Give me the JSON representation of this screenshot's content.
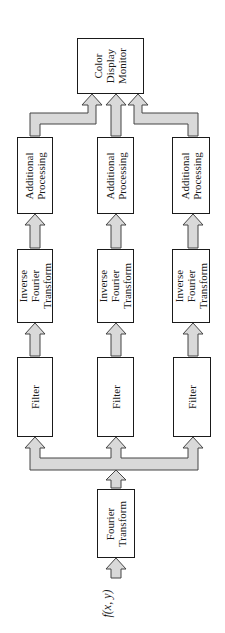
{
  "diagram": {
    "title": "",
    "colors": {
      "arrow_fill": "#d9d9d9",
      "arrow_stroke": "#444444",
      "box_stroke": "#1a1a1a"
    },
    "input_label": "f(x, y)",
    "fourier": {
      "line1": "Fourier",
      "line2": "Transform"
    },
    "channels": [
      {
        "filter": "Filter",
        "ift": {
          "line1": "Inverse",
          "line2": "Fourier",
          "line3": "Transform"
        },
        "proc": {
          "line1": "Additional",
          "line2": "Processing"
        }
      },
      {
        "filter": "Filter",
        "ift": {
          "line1": "Inverse",
          "line2": "Fourier",
          "line3": "Transform"
        },
        "proc": {
          "line1": "Additional",
          "line2": "Processing"
        }
      },
      {
        "filter": "Filter",
        "ift": {
          "line1": "Inverse",
          "line2": "Fourier",
          "line3": "Transform"
        },
        "proc": {
          "line1": "Additional",
          "line2": "Processing"
        }
      }
    ],
    "monitor": {
      "line1": "Color",
      "line2": "Display",
      "line3": "Monitor"
    }
  }
}
